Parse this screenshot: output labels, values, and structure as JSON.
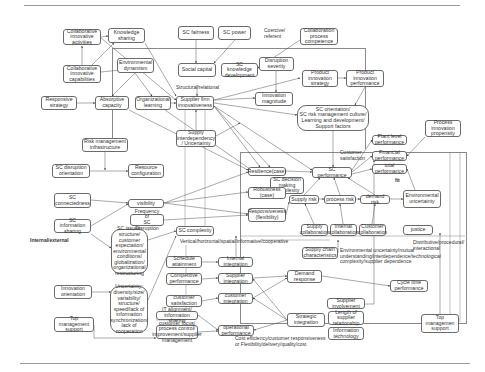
{
  "diagram": {
    "title": "",
    "nodes": [
      {
        "id": "collab-activities",
        "label": "Collaborative\ninnovative\nactivities",
        "x": 63,
        "y": 29,
        "w": 38,
        "h": 16
      },
      {
        "id": "knowledge-sharing",
        "label": "Knowledge\nsharing",
        "x": 108,
        "y": 28,
        "w": 37,
        "h": 15
      },
      {
        "id": "collab-capabilities",
        "label": "Collaborative\ninnovative\ncapabilities",
        "x": 63,
        "y": 65,
        "w": 38,
        "h": 18
      },
      {
        "id": "env-dynamism",
        "label": "Environmental\ndynamism",
        "x": 117,
        "y": 58,
        "w": 37,
        "h": 15
      },
      {
        "id": "responsive-strategy",
        "label": "Responsive\nstrategy",
        "x": 41,
        "y": 96,
        "w": 36,
        "h": 14
      },
      {
        "id": "absorptive-capacity",
        "label": "Absorptive\ncapacity",
        "x": 95,
        "y": 96,
        "w": 34,
        "h": 14
      },
      {
        "id": "org-learning",
        "label": "Organizational\nlearning",
        "x": 135,
        "y": 96,
        "w": 36,
        "h": 14
      },
      {
        "id": "sc-fairness",
        "label": "SC fairness",
        "x": 178,
        "y": 26,
        "w": 36,
        "h": 14
      },
      {
        "id": "sc-power",
        "label": "SC power",
        "x": 218,
        "y": 26,
        "w": 33,
        "h": 14
      },
      {
        "id": "collab-process",
        "label": "Collaboration\nprocess\ncompetence",
        "x": 300,
        "y": 28,
        "w": 38,
        "h": 17
      },
      {
        "id": "social-capital",
        "label": "Social capital",
        "x": 178,
        "y": 63,
        "w": 38,
        "h": 14
      },
      {
        "id": "sc-knowledge-dev",
        "label": "SC knowledge\ndevelopment",
        "x": 221,
        "y": 63,
        "w": 37,
        "h": 14
      },
      {
        "id": "disruption-severity",
        "label": "Disruption\nseverity",
        "x": 259,
        "y": 57,
        "w": 35,
        "h": 14
      },
      {
        "id": "product-innovation-strategy",
        "label": "Product\ninnovation\nstrategy",
        "x": 302,
        "y": 70,
        "w": 36,
        "h": 17
      },
      {
        "id": "product-innovation-performance",
        "label": "Product\ninnovation\nperformance",
        "x": 346,
        "y": 70,
        "w": 38,
        "h": 17
      },
      {
        "id": "supplier-firm-innovativeness",
        "label": "Supplier firm\ninnovativeness",
        "x": 176,
        "y": 96,
        "w": 38,
        "h": 14
      },
      {
        "id": "innovation-magnitude",
        "label": "Innovation\nmagnitude",
        "x": 255,
        "y": 92,
        "w": 38,
        "h": 14
      },
      {
        "id": "sc-orientation",
        "label": "SC orientation/\nSC risk management culture/\nLearning and development/\nSupport factors",
        "x": 297,
        "y": 105,
        "w": 72,
        "h": 26,
        "rounded": true
      },
      {
        "id": "supply-interdependency",
        "label": "Supply\ninterdependency\n/ Uncertainty",
        "x": 176,
        "y": 130,
        "w": 40,
        "h": 17
      },
      {
        "id": "process-innovation-propensity",
        "label": "Process\ninnovation\npropensity",
        "x": 425,
        "y": 120,
        "w": 36,
        "h": 17
      },
      {
        "id": "risk-mgmt-infra",
        "label": "Risk management\ninfrastructure",
        "x": 82,
        "y": 138,
        "w": 46,
        "h": 14
      },
      {
        "id": "plant-level-performance",
        "label": "Plant level\nperformance",
        "x": 372,
        "y": 135,
        "w": 35,
        "h": 10
      },
      {
        "id": "financial-performance",
        "label": "Financial\nperformance",
        "x": 372,
        "y": 151,
        "w": 35,
        "h": 10
      },
      {
        "id": "sc-disruption-orientation",
        "label": "SC disruption\norientation",
        "x": 52,
        "y": 164,
        "w": 38,
        "h": 14
      },
      {
        "id": "resource-configuration",
        "label": "Resource\nconfiguration",
        "x": 128,
        "y": 164,
        "w": 36,
        "h": 14
      },
      {
        "id": "resilience",
        "label": "Resilience(case)",
        "x": 248,
        "y": 167,
        "w": 38,
        "h": 9
      },
      {
        "id": "sc-performance",
        "label": "SC performance",
        "x": 312,
        "y": 167,
        "w": 40,
        "h": 11
      },
      {
        "id": "total-performance",
        "label": "total\nperformance",
        "x": 372,
        "y": 164,
        "w": 35,
        "h": 10
      },
      {
        "id": "sc-decision-complexity",
        "label": "SC decision\nmaking\ncomplexity",
        "x": 270,
        "y": 177,
        "w": 34,
        "h": 17
      },
      {
        "id": "robustness",
        "label": "Robustness\n(case)",
        "x": 248,
        "y": 187,
        "w": 38,
        "h": 12
      },
      {
        "id": "supply-risk",
        "label": "Supply risk",
        "x": 289,
        "y": 195,
        "w": 30,
        "h": 9
      },
      {
        "id": "process-risk",
        "label": "process risk",
        "x": 324,
        "y": 195,
        "w": 32,
        "h": 9
      },
      {
        "id": "demand-risk",
        "label": "demand risk",
        "x": 360,
        "y": 195,
        "w": 30,
        "h": 9
      },
      {
        "id": "environmental-uncertainty",
        "label": "Environmental\nuncertainty",
        "x": 403,
        "y": 190,
        "w": 38,
        "h": 18
      },
      {
        "id": "sc-connectedness",
        "label": "SC\nconnectedness",
        "x": 54,
        "y": 193,
        "w": 37,
        "h": 15
      },
      {
        "id": "visibility",
        "label": "visibility",
        "x": 128,
        "y": 199,
        "w": 36,
        "h": 9
      },
      {
        "id": "sc-information-sharing",
        "label": "SC information\nsharing",
        "x": 54,
        "y": 219,
        "w": 37,
        "h": 14
      },
      {
        "id": "frequency-sc-disruption",
        "label": "Frequency of\nSC Disruption",
        "x": 130,
        "y": 214,
        "w": 34,
        "h": 12
      },
      {
        "id": "responsiveness",
        "label": "Responsiveness\n(flexibility)",
        "x": 248,
        "y": 208,
        "w": 38,
        "h": 14
      },
      {
        "id": "sc-complexity",
        "label": "SC complexity",
        "x": 176,
        "y": 226,
        "w": 38,
        "h": 10
      },
      {
        "id": "supply-collaboration",
        "label": "Supply\ncollaboration",
        "x": 301,
        "y": 224,
        "w": 27,
        "h": 12
      },
      {
        "id": "internal-collaboration",
        "label": "Internal\ncollaboration",
        "x": 330,
        "y": 224,
        "w": 27,
        "h": 12
      },
      {
        "id": "customer-collaboration",
        "label": "Customer\ncollaboration",
        "x": 359,
        "y": 224,
        "w": 27,
        "h": 12
      },
      {
        "id": "justice",
        "label": "justice",
        "x": 403,
        "y": 225,
        "w": 30,
        "h": 10
      },
      {
        "id": "sc-issues",
        "label": "SC issues:\nstructure/\ncustomer\nexpectation/\nenvironmental\nconditions/\nglobalization/\norganizational\nrestructuring",
        "x": 111,
        "y": 229,
        "w": 37,
        "h": 45,
        "rounded": true
      },
      {
        "id": "supply-chain-characteristics",
        "label": "Supply chain\ncharacteristics",
        "x": 302,
        "y": 247,
        "w": 36,
        "h": 12
      },
      {
        "id": "schedule-attainment",
        "label": "Schedule\nattainment",
        "x": 166,
        "y": 256,
        "w": 36,
        "h": 12
      },
      {
        "id": "internal-integration",
        "label": "Internal\nintegration",
        "x": 218,
        "y": 257,
        "w": 35,
        "h": 10
      },
      {
        "id": "competitive-performance",
        "label": "Competitive\nperformance",
        "x": 166,
        "y": 273,
        "w": 36,
        "h": 12
      },
      {
        "id": "supplier-integration",
        "label": "Supplier\nintegration",
        "x": 218,
        "y": 273,
        "w": 35,
        "h": 11
      },
      {
        "id": "demand-response",
        "label": "Demand\nresponse",
        "x": 287,
        "y": 270,
        "w": 35,
        "h": 13
      },
      {
        "id": "uncertainty-box",
        "label": "Uncertainty:\ndiversity/size/\nvariability/\nstructure/\nspeed/lack of\ninformation\nsynchronization/\nlack of\ncooperation",
        "x": 110,
        "y": 286,
        "w": 38,
        "h": 47,
        "rounded": true
      },
      {
        "id": "innovation-orientation",
        "label": "Innovation\norientation",
        "x": 54,
        "y": 285,
        "w": 38,
        "h": 14
      },
      {
        "id": "customer-satisfaction-box",
        "label": "customer\nsatisfaction",
        "x": 166,
        "y": 295,
        "w": 36,
        "h": 12
      },
      {
        "id": "customer-integration",
        "label": "customer\nintegration",
        "x": 218,
        "y": 293,
        "w": 35,
        "h": 11
      },
      {
        "id": "cycle-time-performance",
        "label": "Cycle time\nperformance",
        "x": 390,
        "y": 280,
        "w": 38,
        "h": 12
      },
      {
        "id": "it-alignment",
        "label": "IT alignment/\ninformation sharing",
        "x": 156,
        "y": 311,
        "w": 42,
        "h": 9
      },
      {
        "id": "strategic-integration",
        "label": "Strategic\nintegration",
        "x": 287,
        "y": 313,
        "w": 38,
        "h": 14
      },
      {
        "id": "supplier-involvement",
        "label": "Supplier\ninvolvement",
        "x": 327,
        "y": 298,
        "w": 38,
        "h": 11
      },
      {
        "id": "top-management-support-left",
        "label": "Top management\nsupport",
        "x": 54,
        "y": 317,
        "w": 40,
        "h": 15
      },
      {
        "id": "customer-focus",
        "label": "customer focus/\nprocess control/\nimprovement/supplier\nmanagement",
        "x": 156,
        "y": 325,
        "w": 42,
        "h": 14
      },
      {
        "id": "operational-performance",
        "label": "operational\nperformance",
        "x": 218,
        "y": 325,
        "w": 36,
        "h": 11
      },
      {
        "id": "length-supplier-relationship",
        "label": "Length of\nsupplier\nrelationship",
        "x": 328,
        "y": 311,
        "w": 36,
        "h": 14
      },
      {
        "id": "information-technology",
        "label": "Information\ntechnology",
        "x": 328,
        "y": 327,
        "w": 36,
        "h": 13
      },
      {
        "id": "top-management-support-right",
        "label": "Top\nmanagemen\nsupport",
        "x": 421,
        "y": 314,
        "w": 38,
        "h": 19
      }
    ],
    "labels": [
      {
        "id": "coercive-referent",
        "text": "Coercive/\nreferent",
        "x": 264,
        "y": 28,
        "bold": false
      },
      {
        "id": "structural-relational",
        "text": "Structural/relational",
        "x": 176,
        "y": 85,
        "bold": false
      },
      {
        "id": "customer-satisfaction-label",
        "text": "Customer\nsatisfaction",
        "x": 340,
        "y": 150,
        "bold": false
      },
      {
        "id": "fit",
        "text": "fit",
        "x": 395,
        "y": 178,
        "bold": true
      },
      {
        "id": "internal-external",
        "text": "Internal/external",
        "x": 30,
        "y": 238,
        "bold": true
      },
      {
        "id": "vertical-horizontal",
        "text": "Vertical/horizontal/spatial/informative/cooperative",
        "x": 180,
        "y": 239,
        "bold": false
      },
      {
        "id": "distributive",
        "text": "Distributive/procedural/\ninteractional",
        "x": 413,
        "y": 240,
        "bold": false
      },
      {
        "id": "env-uncertainty-note",
        "text": "Environmental uncertainty/mutual\nunderstanding/interdependence/technological\ncomplexity/supplier dependence",
        "x": 340,
        "y": 248,
        "bold": false
      },
      {
        "id": "cost-efficiency",
        "text": "Cost efficiency/customer responsiveness\nor Flexibility/delivery/quality/cost",
        "x": 235,
        "y": 336,
        "bold": false
      }
    ],
    "colors": {
      "line": "#555555",
      "border": "#6a6a6a",
      "text": "#333333",
      "rule": "#9a9a9a"
    }
  }
}
